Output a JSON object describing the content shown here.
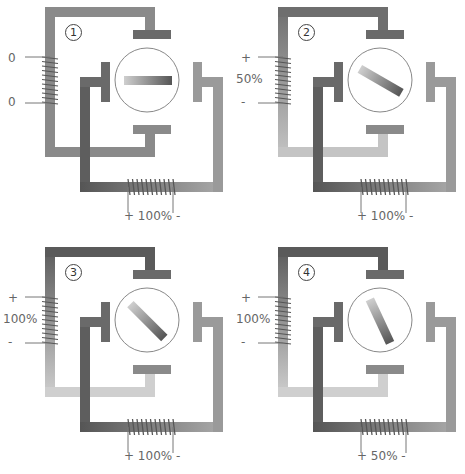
{
  "panels": [
    {
      "number": "1",
      "left_coil": {
        "top": "0",
        "mid": "",
        "bottom": "0"
      },
      "bottom_coil": "+ 100% -",
      "rotor_angle": 0,
      "left_shade": {
        "top": "#8a8a8a",
        "bottom": "#8a8a8a"
      }
    },
    {
      "number": "2",
      "left_coil": {
        "top": "+",
        "mid": "50%",
        "bottom": "-"
      },
      "bottom_coil": "+ 100% -",
      "rotor_angle": 30,
      "left_shade": {
        "top": "#6e6e6e",
        "bottom": "#c4c4c4"
      }
    },
    {
      "number": "3",
      "left_coil": {
        "top": "+",
        "mid": "100%",
        "bottom": "-"
      },
      "bottom_coil": "+ 100% -",
      "rotor_angle": 45,
      "left_shade": {
        "top": "#5a5a5a",
        "bottom": "#cfcfcf"
      }
    },
    {
      "number": "4",
      "left_coil": {
        "top": "+",
        "mid": "100%",
        "bottom": "-"
      },
      "bottom_coil": "+ 50% -",
      "rotor_angle": 65,
      "left_shade": {
        "top": "#5a5a5a",
        "bottom": "#cfcfcf"
      }
    }
  ],
  "colors": {
    "dark": "#5a5a5a",
    "mid": "#8a8a8a",
    "light": "#c8c8c8",
    "coil": "#555555",
    "circle": "#888888"
  }
}
